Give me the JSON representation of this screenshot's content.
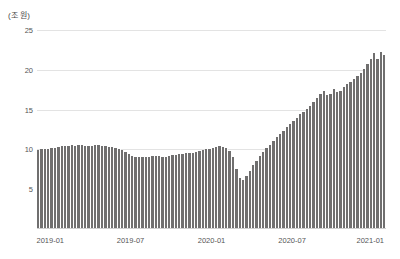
{
  "chart_data": {
    "type": "bar",
    "title": "",
    "subtitle": "",
    "unit_label": "(조 원)",
    "xlabel": "",
    "ylabel": "",
    "ylim": [
      0,
      25
    ],
    "yticks": [
      25,
      20,
      15,
      10,
      5
    ],
    "grid": true,
    "legend": false,
    "bar_color": "#706f6f",
    "grid_color": "#e3e3e3",
    "axis_text_color": "#555555",
    "xtick_labels": [
      "2019-01",
      "2019-07",
      "2020-01",
      "2020-07",
      "2021-01"
    ],
    "xtick_positions": [
      0.038,
      0.268,
      0.5,
      0.731,
      0.955
    ],
    "x_range": [
      "2019-01",
      "2021-02"
    ],
    "categories": [
      "2019-01-a",
      "2019-01-b",
      "2019-01-c",
      "2019-01-d",
      "2019-02-a",
      "2019-02-b",
      "2019-02-c",
      "2019-02-d",
      "2019-03-a",
      "2019-03-b",
      "2019-03-c",
      "2019-03-d",
      "2019-04-a",
      "2019-04-b",
      "2019-04-c",
      "2019-04-d",
      "2019-05-a",
      "2019-05-b",
      "2019-05-c",
      "2019-05-d",
      "2019-06-a",
      "2019-06-b",
      "2019-06-c",
      "2019-06-d",
      "2019-07-a",
      "2019-07-b",
      "2019-07-c",
      "2019-07-d",
      "2019-08-a",
      "2019-08-b",
      "2019-08-c",
      "2019-08-d",
      "2019-09-a",
      "2019-09-b",
      "2019-09-c",
      "2019-09-d",
      "2019-10-a",
      "2019-10-b",
      "2019-10-c",
      "2019-10-d",
      "2019-11-a",
      "2019-11-b",
      "2019-11-c",
      "2019-11-d",
      "2019-12-a",
      "2019-12-b",
      "2019-12-c",
      "2019-12-d",
      "2020-01-a",
      "2020-01-b",
      "2020-01-c",
      "2020-01-d",
      "2020-02-a",
      "2020-02-b",
      "2020-02-c",
      "2020-02-d",
      "2020-03-a",
      "2020-03-b",
      "2020-03-c",
      "2020-03-d",
      "2020-04-a",
      "2020-04-b",
      "2020-04-c",
      "2020-04-d",
      "2020-05-a",
      "2020-05-b",
      "2020-05-c",
      "2020-05-d",
      "2020-06-a",
      "2020-06-b",
      "2020-06-c",
      "2020-06-d",
      "2020-07-a",
      "2020-07-b",
      "2020-07-c",
      "2020-07-d",
      "2020-08-a",
      "2020-08-b",
      "2020-08-c",
      "2020-08-d",
      "2020-09-a",
      "2020-09-b",
      "2020-09-c",
      "2020-09-d",
      "2020-10-a",
      "2020-10-b",
      "2020-10-c",
      "2020-10-d",
      "2020-11-a",
      "2020-11-b",
      "2020-11-c",
      "2020-11-d",
      "2020-12-a",
      "2020-12-b",
      "2020-12-c",
      "2020-12-d",
      "2021-01-a",
      "2021-01-b",
      "2021-01-c",
      "2021-01-d",
      "2021-02-a",
      "2021-02-b",
      "2021-02-c",
      "2021-02-d"
    ],
    "values": [
      9.9,
      10.0,
      10.1,
      10.1,
      10.2,
      10.2,
      10.3,
      10.4,
      10.4,
      10.4,
      10.5,
      10.4,
      10.5,
      10.5,
      10.4,
      10.4,
      10.4,
      10.5,
      10.5,
      10.4,
      10.4,
      10.3,
      10.3,
      10.2,
      10.1,
      9.9,
      9.7,
      9.4,
      9.2,
      9.1,
      9.0,
      9.0,
      9.0,
      9.1,
      9.2,
      9.2,
      9.2,
      9.1,
      9.1,
      9.2,
      9.3,
      9.3,
      9.4,
      9.4,
      9.5,
      9.5,
      9.6,
      9.7,
      9.8,
      9.9,
      10.0,
      10.1,
      10.2,
      10.3,
      10.4,
      10.3,
      10.2,
      9.8,
      9.0,
      7.6,
      6.4,
      6.2,
      6.6,
      7.3,
      8.0,
      8.6,
      9.2,
      9.7,
      10.2,
      10.6,
      11.1,
      11.5,
      11.9,
      12.3,
      12.8,
      13.2,
      13.6,
      14.0,
      14.4,
      14.7,
      15.1,
      15.5,
      16.0,
      16.5,
      16.9,
      17.4,
      16.8,
      17.0,
      17.6,
      17.2,
      17.3,
      17.8,
      18.2,
      18.5,
      18.9,
      19.2,
      19.6,
      20.1,
      20.7,
      21.4,
      22.1,
      21.4,
      22.3,
      21.9
    ],
    "annotations": [
      {
        "text": "sharp trough around 2020-04",
        "value": 6.2
      },
      {
        "text": "peak near series end",
        "value": 22.3
      }
    ]
  }
}
